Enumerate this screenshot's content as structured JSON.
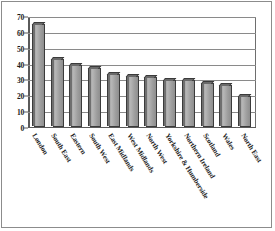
{
  "chart_data": {
    "type": "bar",
    "title": "",
    "subtitle": "",
    "xlabel": "",
    "ylabel": "",
    "ylim": [
      0,
      70
    ],
    "ytick_values": [
      0,
      10,
      20,
      30,
      40,
      50,
      60,
      70
    ],
    "ytick_labels": [
      "0",
      "10",
      "20",
      "30",
      "40",
      "50",
      "60",
      "70"
    ],
    "grid": true,
    "legend": "none",
    "bar_style": "3d-shaded-grey",
    "categories": [
      "London",
      "South East",
      "Eastern",
      "South West",
      "East Midlands",
      "West Midlands",
      "North West",
      "Yorkshire & Humberside",
      "Northern Ireland",
      "Scotland",
      "Wales",
      "North East"
    ],
    "values": [
      66,
      44,
      40,
      38,
      34,
      33,
      32,
      30,
      30,
      28,
      27,
      20
    ],
    "series": [
      {
        "name": "Series 1",
        "values": [
          66,
          44,
          40,
          38,
          34,
          33,
          32,
          30,
          30,
          28,
          27,
          20
        ]
      }
    ],
    "colors": {
      "bar_face": "#a9a9a9",
      "bar_edge": "#3b3b3b",
      "bar_top": "#6a6a6a",
      "gridline": "#8a8a8a",
      "axis": "#5a5a5a",
      "text": "#1a1a1a",
      "background": "#ffffff"
    }
  }
}
